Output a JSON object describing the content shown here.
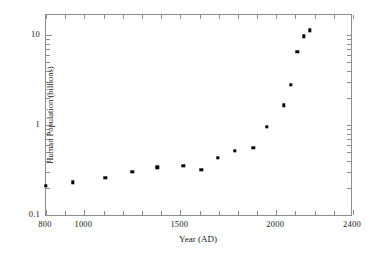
{
  "chart_data": {
    "type": "scatter",
    "title": "",
    "xlabel": "Year (AD)",
    "ylabel": "Human Population (billions)",
    "xlim": [
      800,
      2400
    ],
    "ylim": [
      0.1,
      20
    ],
    "yscale": "log",
    "xscale": "linear",
    "grid": false,
    "legend": null,
    "marker": "filled-square",
    "marker_color": "#000000",
    "frame_color": "#8d8d8d",
    "xticks_major": [
      800,
      1000,
      1500,
      2000,
      2400
    ],
    "xtick_labels": [
      "800",
      "1000",
      "1500",
      "2000",
      "2400"
    ],
    "xticks_minor": [
      900,
      1100,
      1200,
      1300,
      1400,
      1600,
      1700,
      1800,
      1900,
      2100,
      2200,
      2300
    ],
    "yticks_major": [
      10,
      1,
      0.1
    ],
    "ytick_labels": [
      "10",
      "1",
      "0.1"
    ],
    "yticks_minor": [
      0.2,
      0.3,
      0.4,
      0.5,
      0.6,
      0.7,
      0.8,
      0.9,
      2,
      3,
      4,
      5,
      6,
      7,
      8,
      9,
      20
    ],
    "x": [
      800,
      940,
      1110,
      1250,
      1380,
      1515,
      1610,
      1695,
      1785,
      1880,
      1950,
      2040,
      2075,
      2110,
      2145,
      2175
    ],
    "y": [
      0.21,
      0.23,
      0.26,
      0.3,
      0.34,
      0.35,
      0.32,
      0.43,
      0.52,
      0.56,
      0.95,
      1.65,
      2.8,
      6.5,
      9.7,
      11.3
    ],
    "points": [
      {
        "x": 800,
        "y": 0.21
      },
      {
        "x": 940,
        "y": 0.23
      },
      {
        "x": 1110,
        "y": 0.26
      },
      {
        "x": 1250,
        "y": 0.3
      },
      {
        "x": 1380,
        "y": 0.34
      },
      {
        "x": 1515,
        "y": 0.35
      },
      {
        "x": 1610,
        "y": 0.32
      },
      {
        "x": 1695,
        "y": 0.43
      },
      {
        "x": 1785,
        "y": 0.52
      },
      {
        "x": 1880,
        "y": 0.56
      },
      {
        "x": 1950,
        "y": 0.95
      },
      {
        "x": 2040,
        "y": 1.65
      },
      {
        "x": 2075,
        "y": 2.8
      },
      {
        "x": 2110,
        "y": 6.5
      },
      {
        "x": 2145,
        "y": 9.7
      },
      {
        "x": 2175,
        "y": 11.3
      }
    ]
  }
}
